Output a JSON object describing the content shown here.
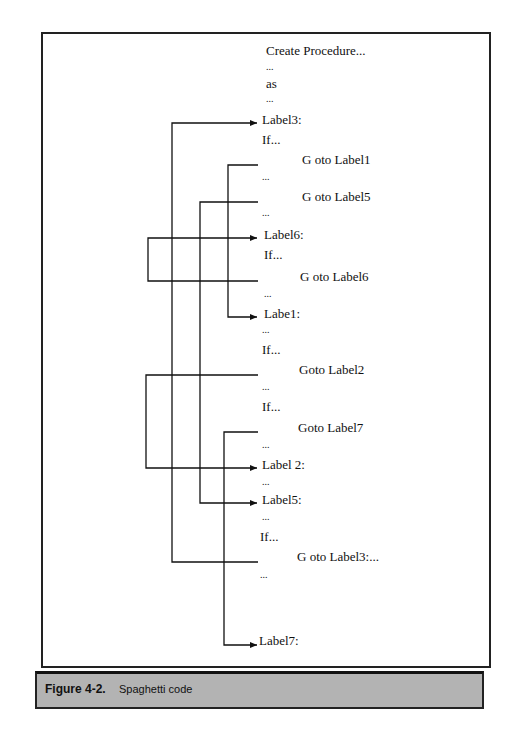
{
  "figure": {
    "number": "Figure 4-2.",
    "title": "Spaghetti code"
  },
  "code_lines": [
    {
      "text": "Create Procedure...",
      "x": 266,
      "y": 50
    },
    {
      "text": "...",
      "x": 266,
      "y": 68,
      "dots": true
    },
    {
      "text": "as",
      "x": 266,
      "y": 83
    },
    {
      "text": "...",
      "x": 266,
      "y": 100,
      "dots": true
    },
    {
      "text": "Label3:",
      "x": 262,
      "y": 119
    },
    {
      "text": "If...",
      "x": 262,
      "y": 139
    },
    {
      "text": "G oto Label1",
      "x": 302,
      "y": 159
    },
    {
      "text": "...",
      "x": 262,
      "y": 178,
      "dots": true
    },
    {
      "text": "G oto Label5",
      "x": 302,
      "y": 196
    },
    {
      "text": "...",
      "x": 262,
      "y": 214,
      "dots": true
    },
    {
      "text": "Label6:",
      "x": 264,
      "y": 234
    },
    {
      "text": "If...",
      "x": 264,
      "y": 254
    },
    {
      "text": "G oto Label6",
      "x": 300,
      "y": 276
    },
    {
      "text": "...",
      "x": 264,
      "y": 295,
      "dots": true
    },
    {
      "text": "Labe1:",
      "x": 264,
      "y": 313
    },
    {
      "text": "...",
      "x": 262,
      "y": 331,
      "dots": true
    },
    {
      "text": "If...",
      "x": 262,
      "y": 349
    },
    {
      "text": "Goto Label2",
      "x": 299,
      "y": 369
    },
    {
      "text": "...",
      "x": 262,
      "y": 388,
      "dots": true
    },
    {
      "text": "If...",
      "x": 262,
      "y": 406
    },
    {
      "text": "Goto Label7",
      "x": 298,
      "y": 427
    },
    {
      "text": "...",
      "x": 262,
      "y": 446,
      "dots": true
    },
    {
      "text": "Label 2:",
      "x": 262,
      "y": 464
    },
    {
      "text": "...",
      "x": 262,
      "y": 483,
      "dots": true
    },
    {
      "text": "Label5:",
      "x": 262,
      "y": 499
    },
    {
      "text": "...",
      "x": 262,
      "y": 518,
      "dots": true
    },
    {
      "text": "If...",
      "x": 260,
      "y": 536
    },
    {
      "text": "G oto Label3:...",
      "x": 297,
      "y": 556
    },
    {
      "text": "...",
      "x": 260,
      "y": 576,
      "dots": true
    },
    {
      "text": "Label7:",
      "x": 259,
      "y": 640
    }
  ],
  "jumps": [
    {
      "from": "G oto Label1",
      "to": "Labe1:",
      "x_route": 228,
      "y_from": 165,
      "y_to": 317
    },
    {
      "from": "G oto Label5",
      "to": "Label5:",
      "x_route": 200,
      "y_from": 202,
      "y_to": 503
    },
    {
      "from": "G oto Label6",
      "to": "Label6:",
      "x_route": 148,
      "y_from": 281,
      "y_to": 238
    },
    {
      "from": "Goto Label2",
      "to": "Label 2:",
      "x_route": 146,
      "y_from": 375,
      "y_to": 468
    },
    {
      "from": "Goto Label7",
      "to": "Label7:",
      "x_route": 224,
      "y_from": 432,
      "y_to": 645
    },
    {
      "from": "G oto Label3:...",
      "to": "Label3:",
      "x_route": 172,
      "y_from": 562,
      "y_to": 123
    }
  ],
  "colors": {
    "line": "#111111",
    "caption_bg": "#b3b3b3"
  }
}
